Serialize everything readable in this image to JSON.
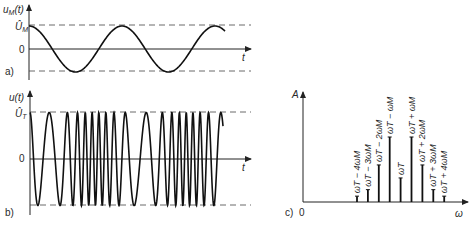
{
  "panel_a": {
    "tag": "a)",
    "y_label": "u",
    "y_label_sub": "M",
    "y_label_arg": "(t)",
    "peak_label": "Û",
    "peak_label_sub": "M",
    "zero_label": "0",
    "x_label": "t",
    "signal": "modulating signal (cosine)",
    "periods_shown": 2.1
  },
  "panel_b": {
    "tag": "b)",
    "y_label": "u(t)",
    "peak_label": "Û",
    "peak_label_sub": "T",
    "zero_label": "0",
    "x_label": "t",
    "signal": "frequency-modulated carrier"
  },
  "panel_c": {
    "tag": "c)",
    "origin_label": "0",
    "y_label": "A",
    "x_label": "ω",
    "lines": [
      {
        "label": "ωT − 4ωM",
        "rel_amplitude": 0.09
      },
      {
        "label": "ωT − 3ωM",
        "rel_amplitude": 0.19
      },
      {
        "label": "ωT − 2ωM",
        "rel_amplitude": 0.57
      },
      {
        "label": "ωT − ωM",
        "rel_amplitude": 1.0
      },
      {
        "label": "ωT",
        "rel_amplitude": 0.37
      },
      {
        "label": "ωT + ωM",
        "rel_amplitude": 1.0
      },
      {
        "label": "ωT + 2ωM",
        "rel_amplitude": 0.57
      },
      {
        "label": "ωT + 3ωM",
        "rel_amplitude": 0.19
      },
      {
        "label": "ωT + 4ωM",
        "rel_amplitude": 0.09
      }
    ]
  }
}
